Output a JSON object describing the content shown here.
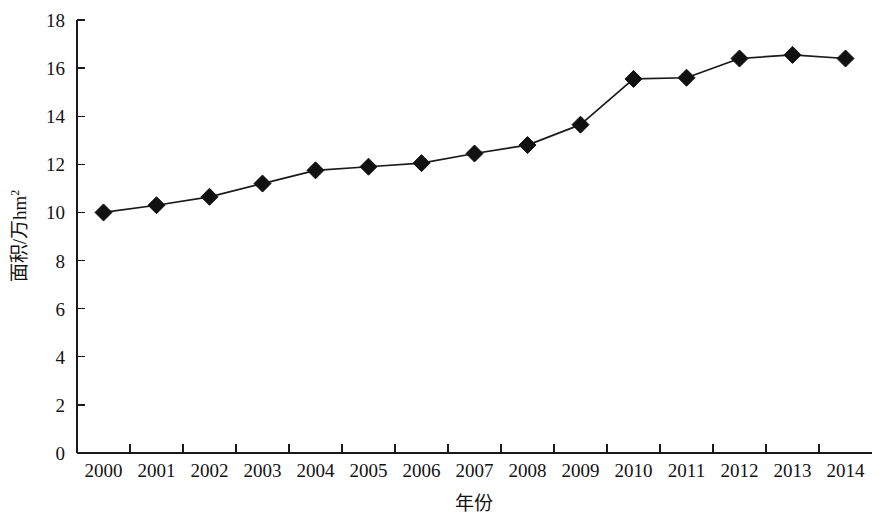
{
  "chart_data": {
    "type": "line",
    "title": "",
    "subtitle": "",
    "xlabel": "年份",
    "ylabel": "面积/万hm²",
    "ylabel_base": "面积/万hm",
    "ylabel_sup": "2",
    "categories": [
      "2000",
      "2001",
      "2002",
      "2003",
      "2004",
      "2005",
      "2006",
      "2007",
      "2008",
      "2009",
      "2010",
      "2011",
      "2012",
      "2013",
      "2014"
    ],
    "values": [
      10.0,
      10.3,
      10.65,
      11.2,
      11.75,
      11.9,
      12.05,
      12.45,
      12.8,
      13.65,
      15.55,
      15.6,
      16.4,
      16.55,
      16.4
    ],
    "series": [
      {
        "name": "面积",
        "values": [
          10.0,
          10.3,
          10.65,
          11.2,
          11.75,
          11.9,
          12.05,
          12.45,
          12.8,
          13.65,
          15.55,
          15.6,
          16.4,
          16.55,
          16.4
        ]
      }
    ],
    "ylim": [
      0,
      18
    ],
    "ytick_values": [
      0,
      2,
      4,
      6,
      8,
      10,
      12,
      14,
      16,
      18
    ],
    "ytick_labels": [
      "0",
      "2",
      "4",
      "6",
      "8",
      "10",
      "12",
      "14",
      "16",
      "18"
    ],
    "xtick_labels": [
      "2000",
      "2001",
      "2002",
      "2003",
      "2004",
      "2005",
      "2006",
      "2007",
      "2008",
      "2009",
      "2010",
      "2011",
      "2012",
      "2013",
      "2014"
    ],
    "grid": false,
    "legend": false,
    "legend_position": "none",
    "marker_shape": "diamond",
    "line_color": "#1a1a1a",
    "marker_color": "#111111",
    "background_color": "#ffffff"
  }
}
